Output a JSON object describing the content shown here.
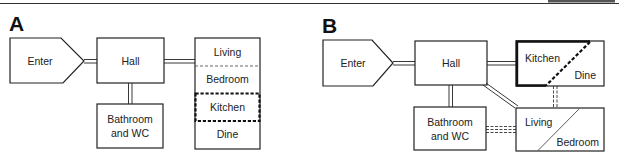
{
  "panels": {
    "a": {
      "letter": "A",
      "rooms": {
        "enter": "Enter",
        "hall": "Hall",
        "bathroom_line1": "Bathroom",
        "bathroom_line2": "and WC",
        "living": "Living",
        "bedroom": "Bedroom",
        "kitchen": "Kitchen",
        "dine": "Dine"
      }
    },
    "b": {
      "letter": "B",
      "rooms": {
        "enter": "Enter",
        "hall": "Hall",
        "bathroom_line1": "Bathroom",
        "bathroom_line2": "and WC",
        "kitchen": "Kitchen",
        "dine": "Dine",
        "living": "Living",
        "bedroom": "Bedroom"
      }
    }
  },
  "colors": {
    "stroke": "#222222",
    "background": "#ffffff"
  }
}
